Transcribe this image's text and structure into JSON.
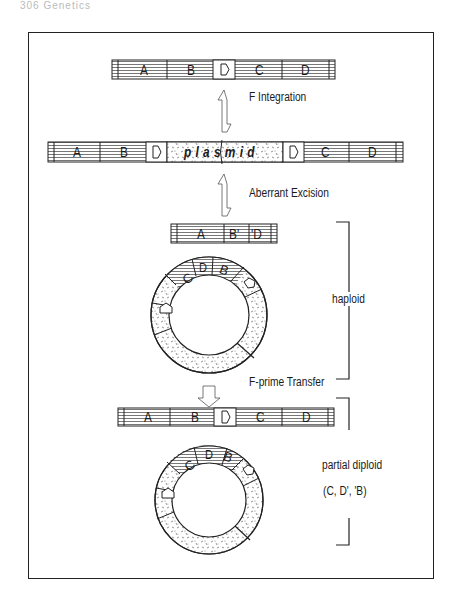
{
  "page_header": "306  Genetics",
  "steps": {
    "integration_label": "F Integration",
    "excision_label": "Aberrant Excision",
    "transfer_label": "F-prime Transfer"
  },
  "chromosome_top": {
    "segments": [
      "A",
      "B",
      "IS-arrow",
      "C",
      "D"
    ]
  },
  "chromosome_integrated": {
    "segments": [
      "A",
      "B",
      "IS-arrow",
      "plasmid",
      "IS-arrow",
      "C",
      "D"
    ],
    "plasmid_label": "plasmid"
  },
  "chromosome_excised": {
    "segments": [
      "A",
      "B'",
      "'D"
    ],
    "labels": {
      "a": "A",
      "b_prime": "B'",
      "d_prime": "'D"
    }
  },
  "fprime_ring": {
    "labels": [
      "C",
      "D",
      "B"
    ],
    "plasmid_label": "plasmid"
  },
  "chromosome_recipient": {
    "segments": [
      "A",
      "B",
      "IS-arrow",
      "C",
      "D"
    ]
  },
  "state_labels": {
    "haploid": "haploid",
    "partial_diploid": "partial diploid",
    "partial_diploid_detail": "(C, D', 'B)"
  },
  "segment_labels": {
    "A": "A",
    "B": "B",
    "C": "C",
    "D": "D",
    "plasmid": "plasmid"
  }
}
